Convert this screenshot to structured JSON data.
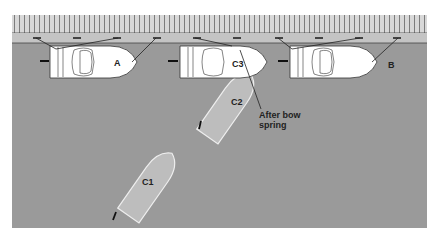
{
  "diagram": {
    "boats": [
      {
        "id": "A",
        "label": "A"
      },
      {
        "id": "B",
        "label": "B"
      },
      {
        "id": "C1",
        "label": "C1"
      },
      {
        "id": "C2",
        "label": "C2"
      },
      {
        "id": "C3",
        "label": "C3"
      }
    ],
    "annotation": {
      "line1": "After bow",
      "line2": "spring"
    },
    "colors": {
      "water": "#9a9a9a",
      "dock": "#c9c9c9",
      "planks": "#d6d6d6",
      "moored_boat": "#ffffff",
      "ghost_boat": "#bdbdbd",
      "line": "#222222"
    }
  }
}
